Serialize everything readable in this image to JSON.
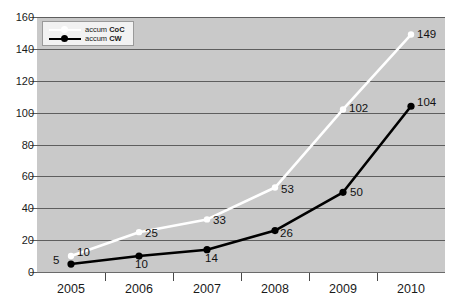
{
  "chart_data": {
    "type": "line",
    "title": "",
    "subtitle": "",
    "xlabel": "",
    "ylabel": "",
    "categories": [
      "2005",
      "2006",
      "2007",
      "2008",
      "2009",
      "2010"
    ],
    "ylim": [
      0,
      160
    ],
    "yticks": [
      0,
      20,
      40,
      60,
      80,
      100,
      120,
      140,
      160
    ],
    "grid": true,
    "legend_position": "top-left",
    "plot_background": "#c9c9c9",
    "series": [
      {
        "name": "accum CoC",
        "color": "#ffffff",
        "marker": "circle-white",
        "values": [
          10,
          25,
          33,
          53,
          102,
          149
        ],
        "labels": [
          "10",
          "25",
          "33",
          "53",
          "102",
          "149"
        ]
      },
      {
        "name": "accum CW",
        "color": "#000000",
        "marker": "circle-black",
        "values": [
          5,
          10,
          14,
          26,
          50,
          104
        ],
        "labels": [
          "5",
          "10",
          "14",
          "26",
          "50",
          "104"
        ]
      }
    ]
  },
  "axes": {
    "y": {
      "tick_labels": [
        "160",
        "140",
        "120",
        "100",
        "80",
        "60",
        "40",
        "20",
        "0"
      ]
    },
    "x": {
      "tick_labels": [
        "2005",
        "2006",
        "2007",
        "2008",
        "2009",
        "2010"
      ]
    }
  },
  "legend": {
    "entries": [
      {
        "label_prefix": "accum ",
        "label_bold": "CoC",
        "style": "white-line"
      },
      {
        "label_prefix": "accum ",
        "label_bold": "CW",
        "style": "black-line-marker"
      }
    ]
  }
}
